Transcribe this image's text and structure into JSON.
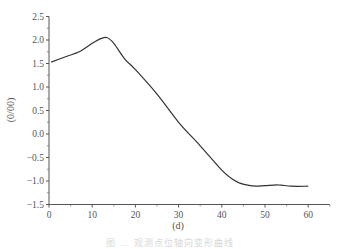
{
  "chart_data": {
    "type": "line",
    "title": "",
    "xlabel": "(d)",
    "ylabel": "(0/00)",
    "xlim": [
      0,
      65
    ],
    "ylim": [
      -1.5,
      2.5
    ],
    "x_ticks": [
      0,
      10,
      20,
      30,
      40,
      50,
      60
    ],
    "x_tick_labels": [
      "0",
      "10",
      "20",
      "30",
      "40",
      "50",
      "60"
    ],
    "y_ticks": [
      2.5,
      2.0,
      1.5,
      1.0,
      0.5,
      0.0,
      -0.5,
      -1.0,
      -1.5
    ],
    "y_tick_labels": [
      "2.5",
      "2.0",
      "1.5",
      "1.0",
      "0.5",
      "0.0",
      "-0.5",
      "-1.0",
      "-1.5"
    ],
    "grid": false,
    "legend": null,
    "series": [
      {
        "name": "curve",
        "color": "#333333",
        "x": [
          0.5,
          4,
          7,
          10,
          12,
          13.5,
          15,
          17.5,
          20,
          25,
          30,
          35,
          40,
          42,
          44,
          46,
          48,
          50,
          53,
          56,
          60
        ],
        "values": [
          1.53,
          1.65,
          1.75,
          1.93,
          2.03,
          2.05,
          1.93,
          1.6,
          1.37,
          0.85,
          0.25,
          -0.25,
          -0.77,
          -0.93,
          -1.04,
          -1.09,
          -1.11,
          -1.1,
          -1.08,
          -1.11,
          -1.11
        ]
      }
    ]
  },
  "caption": "图 … 观测点位轴向变形曲线"
}
